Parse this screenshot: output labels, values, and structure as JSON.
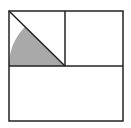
{
  "diagram": {
    "type": "geometry",
    "colors": {
      "background": "#ffffff",
      "stroke": "#222222",
      "shade": "#a9a9a9"
    },
    "outer_square": {
      "x": 9,
      "y": 11,
      "w": 114,
      "h": 110
    },
    "divider_horizontal_y": 66,
    "divider_vertical_x": 65,
    "diagonal": {
      "x1": 9,
      "y1": 11,
      "x2": 65,
      "y2": 66
    },
    "shaded_sector": {
      "cx": 65,
      "cy": 66,
      "r": 56,
      "from_deg": 135,
      "to_deg": 180
    }
  }
}
